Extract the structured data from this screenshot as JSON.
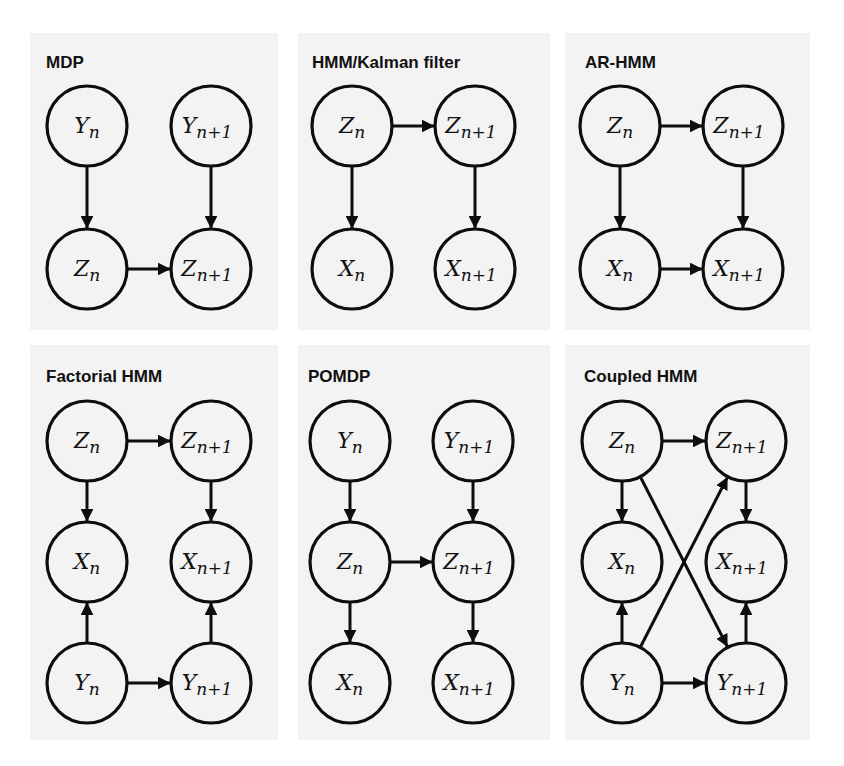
{
  "figure": {
    "width": 844,
    "height": 766,
    "colors": {
      "background": "#ffffff",
      "panel": "#f3f3f3",
      "stroke": "#0d0d0d"
    },
    "node_radius": 40
  },
  "panels": [
    {
      "id": "mdp",
      "title": "MDP",
      "box": [
        30,
        33,
        248,
        297
      ],
      "title_pos": [
        46,
        68
      ],
      "nodes": [
        {
          "id": "Yn",
          "base": "Y",
          "sub": "n",
          "x": 87,
          "y": 126
        },
        {
          "id": "Yn1",
          "base": "Y",
          "sub": "n+1",
          "x": 211,
          "y": 126
        },
        {
          "id": "Zn",
          "base": "Z",
          "sub": "n",
          "x": 87,
          "y": 269
        },
        {
          "id": "Zn1",
          "base": "Z",
          "sub": "n+1",
          "x": 211,
          "y": 269
        }
      ],
      "edges": [
        [
          "Yn",
          "Zn"
        ],
        [
          "Yn1",
          "Zn1"
        ],
        [
          "Zn",
          "Zn1"
        ]
      ]
    },
    {
      "id": "hmm-kalman",
      "title": "HMM/Kalman filter",
      "box": [
        298,
        33,
        252,
        297
      ],
      "title_pos": [
        312,
        68
      ],
      "nodes": [
        {
          "id": "Zn",
          "base": "Z",
          "sub": "n",
          "x": 352,
          "y": 126
        },
        {
          "id": "Zn1",
          "base": "Z",
          "sub": "n+1",
          "x": 475,
          "y": 126
        },
        {
          "id": "Xn",
          "base": "X",
          "sub": "n",
          "x": 352,
          "y": 269
        },
        {
          "id": "Xn1",
          "base": "X",
          "sub": "n+1",
          "x": 475,
          "y": 269
        }
      ],
      "edges": [
        [
          "Zn",
          "Zn1"
        ],
        [
          "Zn",
          "Xn"
        ],
        [
          "Zn1",
          "Xn1"
        ]
      ]
    },
    {
      "id": "ar-hmm",
      "title": "AR-HMM",
      "box": [
        565,
        33,
        245,
        297
      ],
      "title_pos": [
        585,
        68
      ],
      "nodes": [
        {
          "id": "Zn",
          "base": "Z",
          "sub": "n",
          "x": 620,
          "y": 126
        },
        {
          "id": "Zn1",
          "base": "Z",
          "sub": "n+1",
          "x": 743,
          "y": 126
        },
        {
          "id": "Xn",
          "base": "X",
          "sub": "n",
          "x": 620,
          "y": 269
        },
        {
          "id": "Xn1",
          "base": "X",
          "sub": "n+1",
          "x": 743,
          "y": 269
        }
      ],
      "edges": [
        [
          "Zn",
          "Zn1"
        ],
        [
          "Zn",
          "Xn"
        ],
        [
          "Zn1",
          "Xn1"
        ],
        [
          "Xn",
          "Xn1"
        ]
      ]
    },
    {
      "id": "factorial-hmm",
      "title": "Factorial HMM",
      "box": [
        30,
        345,
        248,
        395
      ],
      "title_pos": [
        46,
        382
      ],
      "nodes": [
        {
          "id": "Zn",
          "base": "Z",
          "sub": "n",
          "x": 87,
          "y": 441
        },
        {
          "id": "Zn1",
          "base": "Z",
          "sub": "n+1",
          "x": 211,
          "y": 441
        },
        {
          "id": "Xn",
          "base": "X",
          "sub": "n",
          "x": 87,
          "y": 562
        },
        {
          "id": "Xn1",
          "base": "X",
          "sub": "n+1",
          "x": 211,
          "y": 562
        },
        {
          "id": "Yn",
          "base": "Y",
          "sub": "n",
          "x": 87,
          "y": 683
        },
        {
          "id": "Yn1",
          "base": "Y",
          "sub": "n+1",
          "x": 211,
          "y": 683
        }
      ],
      "edges": [
        [
          "Zn",
          "Zn1"
        ],
        [
          "Zn",
          "Xn"
        ],
        [
          "Zn1",
          "Xn1"
        ],
        [
          "Yn",
          "Xn"
        ],
        [
          "Yn1",
          "Xn1"
        ],
        [
          "Yn",
          "Yn1"
        ]
      ]
    },
    {
      "id": "pomdp",
      "title": "POMDP",
      "box": [
        298,
        345,
        252,
        395
      ],
      "title_pos": [
        308,
        382
      ],
      "nodes": [
        {
          "id": "Yn",
          "base": "Y",
          "sub": "n",
          "x": 350,
          "y": 441
        },
        {
          "id": "Yn1",
          "base": "Y",
          "sub": "n+1",
          "x": 473,
          "y": 441
        },
        {
          "id": "Zn",
          "base": "Z",
          "sub": "n",
          "x": 350,
          "y": 562
        },
        {
          "id": "Zn1",
          "base": "Z",
          "sub": "n+1",
          "x": 473,
          "y": 562
        },
        {
          "id": "Xn",
          "base": "X",
          "sub": "n",
          "x": 350,
          "y": 683
        },
        {
          "id": "Xn1",
          "base": "X",
          "sub": "n+1",
          "x": 473,
          "y": 683
        }
      ],
      "edges": [
        [
          "Yn",
          "Zn"
        ],
        [
          "Yn1",
          "Zn1"
        ],
        [
          "Zn",
          "Zn1"
        ],
        [
          "Zn",
          "Xn"
        ],
        [
          "Zn1",
          "Xn1"
        ]
      ]
    },
    {
      "id": "coupled-hmm",
      "title": "Coupled HMM",
      "box": [
        565,
        345,
        245,
        395
      ],
      "title_pos": [
        584,
        382
      ],
      "nodes": [
        {
          "id": "Zn",
          "base": "Z",
          "sub": "n",
          "x": 622,
          "y": 441
        },
        {
          "id": "Zn1",
          "base": "Z",
          "sub": "n+1",
          "x": 746,
          "y": 441
        },
        {
          "id": "Xn",
          "base": "X",
          "sub": "n",
          "x": 622,
          "y": 562
        },
        {
          "id": "Xn1",
          "base": "X",
          "sub": "n+1",
          "x": 746,
          "y": 562
        },
        {
          "id": "Yn",
          "base": "Y",
          "sub": "n",
          "x": 622,
          "y": 683
        },
        {
          "id": "Yn1",
          "base": "Y",
          "sub": "n+1",
          "x": 746,
          "y": 683
        }
      ],
      "edges": [
        [
          "Zn",
          "Zn1"
        ],
        [
          "Zn",
          "Xn"
        ],
        [
          "Zn1",
          "Xn1"
        ],
        [
          "Yn",
          "Xn"
        ],
        [
          "Yn1",
          "Xn1"
        ],
        [
          "Yn",
          "Yn1"
        ],
        [
          "Zn",
          "Yn1"
        ],
        [
          "Yn",
          "Zn1"
        ]
      ]
    }
  ]
}
